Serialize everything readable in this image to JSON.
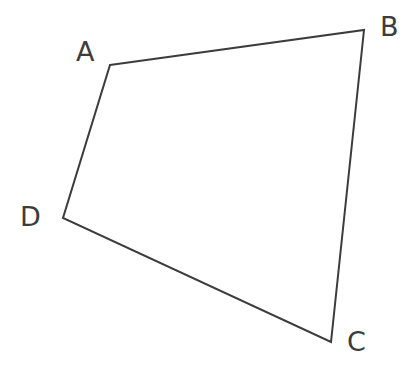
{
  "figure": {
    "name": "quadrilateral-abcd",
    "type": "geometric-diagram",
    "background_color": "#ffffff",
    "stroke_color": "#3c3c3c",
    "stroke_width": 2,
    "label_color": "#3c3c3c",
    "canvas": {
      "width": 409,
      "height": 368
    }
  },
  "shape": {
    "kind": "quadrilateral",
    "closed": true,
    "fill": "none",
    "points_attr": "110,65 364,30 331,342 63,218",
    "vertices": [
      {
        "id": "A",
        "label": "A",
        "x": 110,
        "y": 65
      },
      {
        "id": "B",
        "label": "B",
        "x": 364,
        "y": 30
      },
      {
        "id": "C",
        "label": "C",
        "x": 331,
        "y": 342
      },
      {
        "id": "D",
        "label": "D",
        "x": 63,
        "y": 218
      }
    ],
    "edges": [
      {
        "id": "AB",
        "from": "A",
        "to": "B"
      },
      {
        "id": "BC",
        "from": "B",
        "to": "C"
      },
      {
        "id": "CD",
        "from": "C",
        "to": "D"
      },
      {
        "id": "DA",
        "from": "D",
        "to": "A"
      }
    ]
  },
  "labels": {
    "A": {
      "text": "A",
      "left": 76,
      "top": 38
    },
    "B": {
      "text": "B",
      "left": 380,
      "top": 13
    },
    "C": {
      "text": "C",
      "left": 347,
      "top": 328
    },
    "D": {
      "text": "D",
      "left": 20,
      "top": 203
    }
  }
}
